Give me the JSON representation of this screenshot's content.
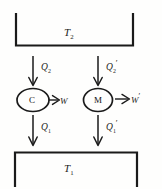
{
  "figure": {
    "type": "thermodynamics-heat-engine-diagram",
    "title": "",
    "reservoirs": {
      "hot": {
        "label": "T",
        "subscript": "2",
        "name": "upper-reservoir",
        "shape": "open-top-bracket"
      },
      "cold": {
        "label": "T",
        "subscript": "1",
        "name": "lower-reservoir",
        "shape": "open-bottom-bracket"
      }
    },
    "engines": [
      {
        "id": "carnot",
        "label": "C",
        "shape": "ellipse"
      },
      {
        "id": "machine",
        "label": "M",
        "shape": "ellipse"
      }
    ],
    "heat_flows": [
      {
        "id": "q2",
        "label": "Q",
        "subscript": "2",
        "prime": "",
        "direction": "down",
        "from": "T2",
        "to": "C"
      },
      {
        "id": "q2p",
        "label": "Q",
        "subscript": "2",
        "prime": "′",
        "direction": "down",
        "from": "T2",
        "to": "M"
      },
      {
        "id": "q1",
        "label": "Q",
        "subscript": "1",
        "prime": "",
        "direction": "down",
        "from": "C",
        "to": "T1"
      },
      {
        "id": "q1p",
        "label": "Q",
        "subscript": "1",
        "prime": "′",
        "direction": "down",
        "from": "M",
        "to": "T1"
      }
    ],
    "work_outputs": [
      {
        "id": "w",
        "label": "W",
        "prime": "",
        "direction": "right",
        "from": "C"
      },
      {
        "id": "wp",
        "label": "W",
        "prime": "′",
        "direction": "right",
        "from": "M"
      }
    ],
    "stroke_color": "#1a1a1a",
    "background_color": "#fefefd"
  }
}
